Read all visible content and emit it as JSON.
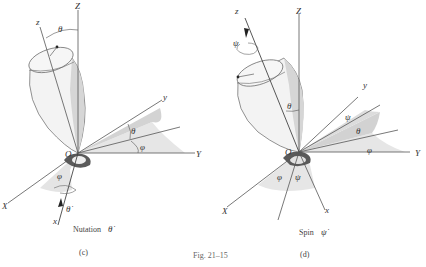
{
  "figure": {
    "caption": "Fig. 21–15"
  },
  "panels": [
    {
      "id": "c",
      "label": "(c)",
      "title": "Nutation",
      "rate_symbol": "θ̇",
      "axes": {
        "Z": "Z",
        "z": "z",
        "Y": "Y",
        "y": "y",
        "X": "X",
        "x": "x",
        "O": "O"
      },
      "angles": {
        "theta_top": "θ",
        "theta_right": "θ",
        "phi_right": "φ",
        "phi_bottom": "φ",
        "theta_dot_arrow": "θ̇"
      }
    },
    {
      "id": "d",
      "label": "(d)",
      "title": "Spin",
      "rate_symbol": "ψ̇",
      "axes": {
        "Z": "Z",
        "z": "z",
        "Y": "Y",
        "y": "y",
        "X": "X",
        "x": "x",
        "O": "O"
      },
      "angles": {
        "psi_top": "ψ",
        "theta_mid": "θ",
        "psi_right": "ψ",
        "theta_right": "θ",
        "phi_right": "φ",
        "phi_bottom": "φ",
        "psi_bottom": "ψ"
      }
    }
  ],
  "colors": {
    "shade_light": "#e6e6e6",
    "shade_mid": "#cfcfcf",
    "shade_dark": "#555555",
    "top_body": "#f2f2f2",
    "axis": "#555555"
  }
}
